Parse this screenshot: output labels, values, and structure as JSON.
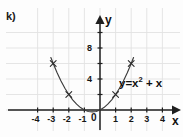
{
  "figure": {
    "part_label": "k)",
    "equation": {
      "lhs": "y=x",
      "exponent": "2",
      "rhs": " + x"
    }
  },
  "axes": {
    "x_name": "x",
    "y_name": "y",
    "origin_label": "0"
  },
  "chart_data": {
    "type": "line",
    "title": "",
    "subtitle": "",
    "annotations": [
      "y=x² + x"
    ],
    "xlabel": "x",
    "ylabel": "y",
    "xlim": [
      -4.8,
      4.9
    ],
    "ylim": [
      -1.5,
      10.5
    ],
    "grid": true,
    "grid_color": "#e2e2e2",
    "curve_color": "#3c3c3c",
    "axis_color": "#1f1f1f",
    "legend": [],
    "x_ticks": [
      -4,
      -3,
      -2,
      -1,
      0,
      1,
      2,
      3,
      4
    ],
    "x_tick_labels": [
      "-4",
      "-3",
      "-2",
      "-1",
      "0",
      "1",
      "2",
      "3",
      "4"
    ],
    "y_ticks": [
      2,
      4,
      6,
      8,
      10
    ],
    "y_tick_labels": [
      "",
      "4",
      "",
      "8",
      ""
    ],
    "function": "y = x^2 + x",
    "marked_points": [
      {
        "x": -3,
        "y": 6,
        "marker": "x"
      },
      {
        "x": -2,
        "y": 2,
        "marker": "x"
      },
      {
        "x": 1,
        "y": 2,
        "marker": "x"
      },
      {
        "x": 2,
        "y": 6,
        "marker": "x"
      }
    ],
    "vertex": {
      "x": -0.5,
      "y": -0.25
    },
    "roots": [
      -1,
      0
    ],
    "curve_points": [
      {
        "x": -3.15,
        "y": 6.77
      },
      {
        "x": -3.0,
        "y": 6.0
      },
      {
        "x": -2.75,
        "y": 4.81
      },
      {
        "x": -2.5,
        "y": 3.75
      },
      {
        "x": -2.25,
        "y": 2.81
      },
      {
        "x": -2.0,
        "y": 2.0
      },
      {
        "x": -1.75,
        "y": 1.31
      },
      {
        "x": -1.5,
        "y": 0.75
      },
      {
        "x": -1.25,
        "y": 0.31
      },
      {
        "x": -1.0,
        "y": 0.0
      },
      {
        "x": -0.75,
        "y": -0.19
      },
      {
        "x": -0.5,
        "y": -0.25
      },
      {
        "x": -0.25,
        "y": -0.19
      },
      {
        "x": 0.0,
        "y": 0.0
      },
      {
        "x": 0.25,
        "y": 0.31
      },
      {
        "x": 0.5,
        "y": 0.75
      },
      {
        "x": 0.75,
        "y": 1.31
      },
      {
        "x": 1.0,
        "y": 2.0
      },
      {
        "x": 1.25,
        "y": 2.81
      },
      {
        "x": 1.5,
        "y": 3.75
      },
      {
        "x": 1.75,
        "y": 4.81
      },
      {
        "x": 2.0,
        "y": 6.0
      },
      {
        "x": 2.15,
        "y": 6.77
      }
    ]
  }
}
